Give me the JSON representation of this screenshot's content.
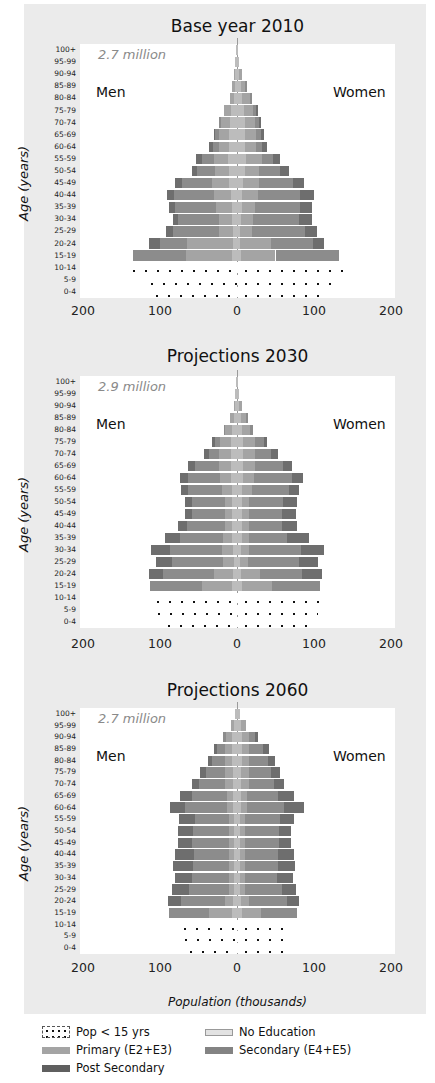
{
  "chart_data": [
    {
      "type": "bar",
      "subtype": "population-pyramid",
      "title": "Base year 2010",
      "total": "2.7 million",
      "left_label": "Men",
      "right_label": "Women",
      "ylabel": "Age (years)",
      "xlabel": "Population (thousands)",
      "xticks": [
        "200",
        "100",
        "0",
        "100",
        "200"
      ],
      "xlim": [
        -200,
        200
      ],
      "categories": [
        "100+",
        "95-99",
        "90-94",
        "85-89",
        "80-84",
        "75-79",
        "70-74",
        "65-69",
        "60-64",
        "55-59",
        "50-54",
        "45-49",
        "40-44",
        "35-39",
        "30-34",
        "25-29",
        "20-24",
        "15-19",
        "10-14",
        "5-9",
        "0-4"
      ],
      "men_total": [
        1,
        2,
        4,
        6,
        9,
        17,
        23,
        30,
        36,
        53,
        58,
        80,
        91,
        88,
        83,
        92,
        114,
        135,
        145,
        122,
        116
      ],
      "women_total": [
        1,
        3,
        6,
        13,
        20,
        27,
        31,
        35,
        39,
        56,
        68,
        87,
        100,
        98,
        97,
        104,
        113,
        132,
        150,
        125,
        120
      ],
      "men_segments": [
        [
          1,
          0,
          0,
          0
        ],
        [
          2,
          0,
          0,
          0
        ],
        [
          2,
          2,
          0,
          0
        ],
        [
          3,
          3,
          0,
          0
        ],
        [
          4,
          5,
          0,
          0
        ],
        [
          8,
          9,
          0,
          0
        ],
        [
          9,
          12,
          2,
          0
        ],
        [
          10,
          14,
          4,
          2
        ],
        [
          10,
          14,
          7,
          5
        ],
        [
          12,
          18,
          16,
          7
        ],
        [
          10,
          18,
          24,
          6
        ],
        [
          10,
          22,
          40,
          8
        ],
        [
          8,
          22,
          52,
          9
        ],
        [
          7,
          20,
          53,
          8
        ],
        [
          6,
          18,
          52,
          7
        ],
        [
          5,
          18,
          60,
          9
        ],
        [
          5,
          60,
          35,
          14
        ],
        [
          6,
          60,
          69,
          0
        ],
        [
          145,
          0,
          0,
          0
        ],
        [
          122,
          0,
          0,
          0
        ],
        [
          116,
          0,
          0,
          0
        ]
      ],
      "women_segments": [
        [
          1,
          0,
          0,
          0
        ],
        [
          3,
          0,
          0,
          0
        ],
        [
          3,
          3,
          0,
          0
        ],
        [
          5,
          6,
          2,
          0
        ],
        [
          7,
          10,
          3,
          0
        ],
        [
          9,
          12,
          4,
          2
        ],
        [
          10,
          13,
          5,
          3
        ],
        [
          10,
          15,
          6,
          4
        ],
        [
          10,
          15,
          8,
          6
        ],
        [
          12,
          20,
          15,
          9
        ],
        [
          10,
          18,
          28,
          12
        ],
        [
          8,
          20,
          45,
          14
        ],
        [
          7,
          20,
          55,
          18
        ],
        [
          6,
          18,
          58,
          16
        ],
        [
          5,
          16,
          60,
          16
        ],
        [
          4,
          16,
          68,
          16
        ],
        [
          4,
          40,
          55,
          14
        ],
        [
          5,
          45,
          82,
          0
        ],
        [
          150,
          0,
          0,
          0
        ],
        [
          125,
          0,
          0,
          0
        ],
        [
          120,
          0,
          0,
          0
        ]
      ],
      "under15_groups": [
        "10-14",
        "5-9",
        "0-4"
      ]
    },
    {
      "type": "bar",
      "subtype": "population-pyramid",
      "title": "Projections 2030",
      "total": "2.9 million",
      "left_label": "Men",
      "right_label": "Women",
      "ylabel": "Age (years)",
      "xlabel": "Population (thousands)",
      "xticks": [
        "200",
        "100",
        "0",
        "100",
        "200"
      ],
      "xlim": [
        -200,
        200
      ],
      "categories": [
        "100+",
        "95-99",
        "90-94",
        "85-89",
        "80-84",
        "75-79",
        "70-74",
        "65-69",
        "60-64",
        "55-59",
        "50-54",
        "45-49",
        "40-44",
        "35-39",
        "30-34",
        "25-29",
        "20-24",
        "15-19",
        "10-14",
        "5-9",
        "0-4"
      ],
      "men_total": [
        1,
        2,
        4,
        9,
        17,
        33,
        43,
        63,
        74,
        73,
        68,
        68,
        77,
        94,
        112,
        105,
        114,
        113,
        114,
        113,
        100
      ],
      "women_total": [
        1,
        2,
        6,
        14,
        21,
        39,
        53,
        72,
        86,
        81,
        78,
        77,
        78,
        93,
        113,
        105,
        110,
        108,
        110,
        105,
        104
      ],
      "men_segments": [
        [
          1,
          0,
          0,
          0
        ],
        [
          2,
          0,
          0,
          0
        ],
        [
          2,
          2,
          0,
          0
        ],
        [
          4,
          5,
          0,
          0
        ],
        [
          6,
          9,
          2,
          0
        ],
        [
          8,
          14,
          7,
          4
        ],
        [
          8,
          16,
          12,
          7
        ],
        [
          8,
          16,
          30,
          9
        ],
        [
          8,
          14,
          42,
          10
        ],
        [
          7,
          12,
          44,
          10
        ],
        [
          6,
          10,
          43,
          9
        ],
        [
          6,
          10,
          43,
          9
        ],
        [
          6,
          10,
          49,
          12
        ],
        [
          6,
          12,
          56,
          20
        ],
        [
          5,
          14,
          68,
          25
        ],
        [
          4,
          14,
          67,
          20
        ],
        [
          5,
          25,
          66,
          18
        ],
        [
          6,
          40,
          67,
          0
        ],
        [
          114,
          0,
          0,
          0
        ],
        [
          113,
          0,
          0,
          0
        ],
        [
          100,
          0,
          0,
          0
        ]
      ],
      "women_segments": [
        [
          1,
          0,
          0,
          0
        ],
        [
          2,
          0,
          0,
          0
        ],
        [
          3,
          3,
          0,
          0
        ],
        [
          5,
          7,
          2,
          0
        ],
        [
          7,
          10,
          4,
          0
        ],
        [
          8,
          15,
          12,
          4
        ],
        [
          8,
          16,
          20,
          9
        ],
        [
          8,
          16,
          36,
          12
        ],
        [
          8,
          14,
          50,
          14
        ],
        [
          7,
          12,
          48,
          14
        ],
        [
          6,
          10,
          44,
          18
        ],
        [
          6,
          10,
          43,
          18
        ],
        [
          6,
          9,
          43,
          20
        ],
        [
          6,
          9,
          50,
          28
        ],
        [
          5,
          10,
          68,
          30
        ],
        [
          4,
          10,
          66,
          25
        ],
        [
          5,
          25,
          55,
          25
        ],
        [
          6,
          40,
          62,
          0
        ],
        [
          110,
          0,
          0,
          0
        ],
        [
          105,
          0,
          0,
          0
        ],
        [
          104,
          0,
          0,
          0
        ]
      ],
      "under15_groups": [
        "10-14",
        "5-9",
        "0-4"
      ]
    },
    {
      "type": "bar",
      "subtype": "population-pyramid",
      "title": "Projections 2060",
      "total": "2.7 million",
      "left_label": "Men",
      "right_label": "Women",
      "ylabel": "Age (years)",
      "xlabel": "Population (thousands)",
      "xticks": [
        "200",
        "100",
        "0",
        "100",
        "200"
      ],
      "xlim": [
        -200,
        200
      ],
      "categories": [
        "100+",
        "95-99",
        "90-94",
        "85-89",
        "80-84",
        "75-79",
        "70-74",
        "65-69",
        "60-64",
        "55-59",
        "50-54",
        "45-49",
        "40-44",
        "35-39",
        "30-34",
        "25-29",
        "20-24",
        "15-19",
        "10-14",
        "5-9",
        "0-4"
      ],
      "men_total": [
        3,
        8,
        18,
        30,
        38,
        48,
        59,
        74,
        87,
        75,
        77,
        77,
        80,
        83,
        80,
        84,
        90,
        88,
        79,
        78,
        71
      ],
      "women_total": [
        4,
        12,
        27,
        42,
        50,
        56,
        61,
        74,
        87,
        74,
        70,
        70,
        74,
        75,
        73,
        76,
        81,
        78,
        66,
        64,
        65
      ],
      "men_segments": [
        [
          3,
          0,
          0,
          0
        ],
        [
          4,
          4,
          0,
          0
        ],
        [
          6,
          8,
          4,
          0
        ],
        [
          6,
          10,
          10,
          4
        ],
        [
          6,
          10,
          16,
          6
        ],
        [
          5,
          10,
          25,
          8
        ],
        [
          5,
          10,
          34,
          10
        ],
        [
          5,
          8,
          45,
          16
        ],
        [
          5,
          8,
          54,
          20
        ],
        [
          4,
          7,
          44,
          20
        ],
        [
          4,
          7,
          46,
          20
        ],
        [
          4,
          7,
          47,
          19
        ],
        [
          4,
          6,
          46,
          24
        ],
        [
          4,
          6,
          47,
          26
        ],
        [
          4,
          6,
          48,
          22
        ],
        [
          4,
          6,
          52,
          22
        ],
        [
          5,
          10,
          58,
          17
        ],
        [
          6,
          30,
          52,
          0
        ],
        [
          79,
          0,
          0,
          0
        ],
        [
          78,
          0,
          0,
          0
        ],
        [
          71,
          0,
          0,
          0
        ]
      ],
      "women_segments": [
        [
          4,
          0,
          0,
          0
        ],
        [
          5,
          7,
          0,
          0
        ],
        [
          6,
          10,
          8,
          3
        ],
        [
          6,
          10,
          18,
          8
        ],
        [
          6,
          10,
          24,
          10
        ],
        [
          5,
          10,
          29,
          12
        ],
        [
          5,
          10,
          33,
          13
        ],
        [
          5,
          8,
          40,
          21
        ],
        [
          5,
          8,
          48,
          26
        ],
        [
          4,
          7,
          45,
          18
        ],
        [
          4,
          7,
          44,
          15
        ],
        [
          4,
          7,
          44,
          15
        ],
        [
          4,
          6,
          43,
          21
        ],
        [
          4,
          6,
          43,
          22
        ],
        [
          4,
          6,
          42,
          21
        ],
        [
          4,
          6,
          48,
          18
        ],
        [
          5,
          10,
          50,
          16
        ],
        [
          6,
          25,
          47,
          0
        ],
        [
          66,
          0,
          0,
          0
        ],
        [
          64,
          0,
          0,
          0
        ],
        [
          65,
          0,
          0,
          0
        ]
      ],
      "under15_groups": [
        "10-14",
        "5-9",
        "0-4"
      ]
    }
  ],
  "panels": [
    {
      "title": "Base year 2010",
      "total": "2.7 million",
      "men": "Men",
      "women": "Women",
      "ylabel": "Age (years)"
    },
    {
      "title": "Projections 2030",
      "total": "2.9 million",
      "men": "Men",
      "women": "Women",
      "ylabel": "Age (years)"
    },
    {
      "title": "Projections 2060",
      "total": "2.7 million",
      "men": "Men",
      "women": "Women",
      "ylabel": "Age (years)"
    }
  ],
  "xlabel": "Population (thousands)",
  "colors": {
    "background": "#ebebeb",
    "plot": "#ffffff",
    "no_education": "#bcbcbc",
    "primary": "#a4a4a4",
    "secondary": "#8c8c8c",
    "post_secondary": "#6e6e6e",
    "under15_dots": "#111111"
  },
  "legend": [
    {
      "label": "Pop < 15 yrs",
      "key": "under15"
    },
    {
      "label": "No Education",
      "key": "no_education"
    },
    {
      "label": "Primary (E2+E3)",
      "key": "primary"
    },
    {
      "label": "Secondary (E4+E5)",
      "key": "secondary"
    },
    {
      "label": "Post Secondary",
      "key": "post_secondary"
    }
  ]
}
